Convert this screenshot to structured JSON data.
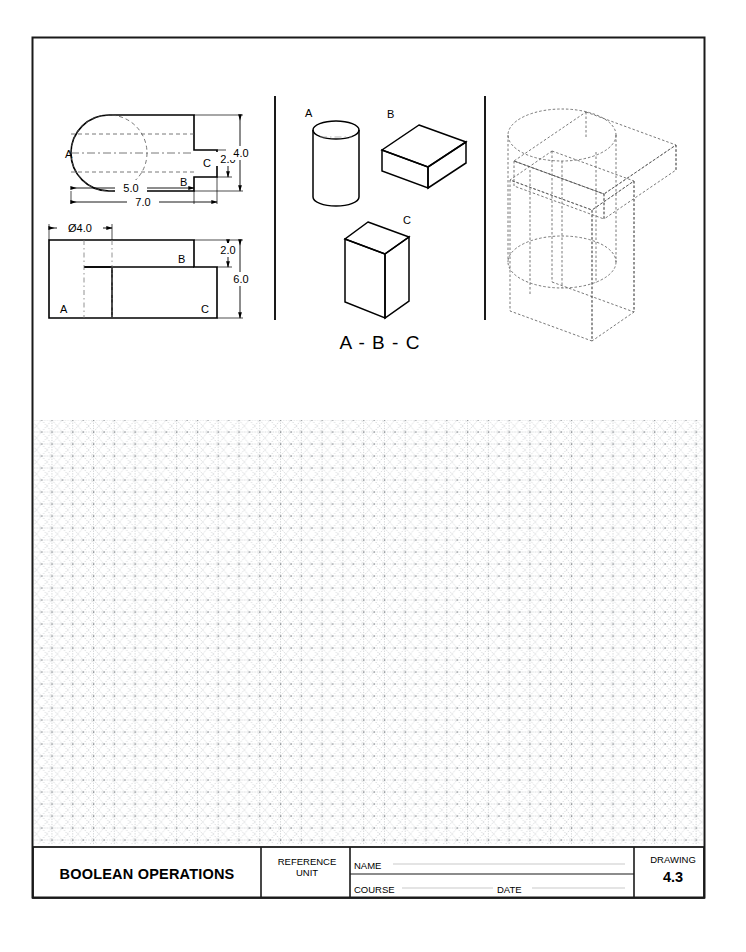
{
  "sheet": {
    "border": {
      "x": 32,
      "y": 37,
      "width": 673,
      "height": 861,
      "color": "#1a1a1a"
    }
  },
  "panels": {
    "orthographic": {
      "name": "orthographic-views",
      "top_view": {
        "part_labels": [
          "A",
          "B",
          "C"
        ],
        "dimensions": [
          {
            "label": "5.0",
            "type": "horizontal"
          },
          {
            "label": "7.0",
            "type": "horizontal"
          },
          {
            "label": "2.0",
            "type": "vertical"
          },
          {
            "label": "4.0",
            "type": "vertical"
          }
        ]
      },
      "front_view": {
        "part_labels": [
          "A",
          "B",
          "C"
        ],
        "dimensions": [
          {
            "label": "Ø4.0",
            "type": "horizontal"
          },
          {
            "label": "2.0",
            "type": "vertical"
          },
          {
            "label": "6.0",
            "type": "vertical"
          }
        ]
      }
    },
    "solids": {
      "name": "component-solids",
      "items": [
        {
          "label": "A",
          "shape": "cylinder"
        },
        {
          "label": "B",
          "shape": "flat-box"
        },
        {
          "label": "C",
          "shape": "tall-slab"
        }
      ],
      "combination_label": "A - B - C"
    },
    "isometric": {
      "name": "isometric-wireframe",
      "description": "combined wireframe isometric of A, B and C"
    }
  },
  "grid": {
    "name": "isometric-grid",
    "x": 33,
    "y": 420,
    "width": 671,
    "height": 424,
    "spacing": 12,
    "color": "#9aa0a6"
  },
  "title_block": {
    "drawing_title": "BOOLEAN OPERATIONS",
    "reference_unit": "REFERENCE\nUNIT",
    "name_label": "NAME",
    "course_label": "COURSE",
    "date_label": "DATE",
    "drawing_label": "DRAWING",
    "drawing_number": "4.3"
  },
  "colors": {
    "ink": "#000000",
    "border": "#1a1a1a",
    "hidden": "#555555",
    "grid": "#9aa0a6"
  }
}
